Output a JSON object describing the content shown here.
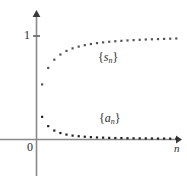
{
  "figure": {
    "title": "",
    "axes": {
      "x_axis_label": "n",
      "y_tick_label": "1",
      "origin_label": "0"
    },
    "series_labels": {
      "partial_sums": {
        "brace_open": "{",
        "var": "s",
        "sub": "n",
        "brace_close": "}"
      },
      "terms": {
        "brace_open": "{",
        "var": "a",
        "sub": "n",
        "brace_close": "}"
      }
    }
  },
  "chart_data": {
    "type": "scatter",
    "title": "",
    "xlabel": "n",
    "ylabel": "",
    "xlim": [
      0,
      26
    ],
    "ylim": [
      0,
      1.15
    ],
    "grid": false,
    "legend": "inline-annotations",
    "y_ticks": [
      1
    ],
    "y_tick_labels": [
      "1"
    ],
    "x_ticks": [],
    "origin_label": "0",
    "series": [
      {
        "name": "{s_n}",
        "label": "{s_n}",
        "marker": "dot",
        "color": "#555555",
        "x": [
          1,
          2,
          3,
          4,
          5,
          6,
          7,
          8,
          9,
          10,
          11,
          12,
          13,
          14,
          15,
          16,
          17,
          18,
          19,
          20,
          21,
          22,
          23
        ],
        "y": [
          0.53,
          0.69,
          0.77,
          0.82,
          0.855,
          0.88,
          0.897,
          0.911,
          0.922,
          0.931,
          0.938,
          0.944,
          0.949,
          0.953,
          0.957,
          0.96,
          0.963,
          0.966,
          0.968,
          0.97,
          0.972,
          0.974,
          0.976
        ],
        "annotation": {
          "text": "{s_n}",
          "x": 11.5,
          "y": 0.72
        }
      },
      {
        "name": "{a_n}",
        "label": "{a_n}",
        "marker": "dot",
        "color": "#222222",
        "x": [
          1,
          2,
          3,
          4,
          5,
          6,
          7,
          8,
          9,
          10,
          11,
          12,
          13,
          14,
          15,
          16,
          17,
          18,
          19,
          20,
          21,
          22,
          23
        ],
        "y": [
          0.215,
          0.125,
          0.082,
          0.058,
          0.043,
          0.033,
          0.027,
          0.022,
          0.018,
          0.015,
          0.013,
          0.011,
          0.0095,
          0.0085,
          0.0075,
          0.0065,
          0.006,
          0.0055,
          0.005,
          0.0045,
          0.004,
          0.0035,
          0.003
        ],
        "annotation": {
          "text": "{a_n}",
          "x": 11.6,
          "y": 0.2
        }
      }
    ]
  },
  "geometry": {
    "origin_px": {
      "x": 36,
      "y": 139
    },
    "y_one_px": 36,
    "x_axis_end_px": 180,
    "y_axis_top_px": 12,
    "x_step_px": 6.1,
    "axis_color": "#777777"
  }
}
